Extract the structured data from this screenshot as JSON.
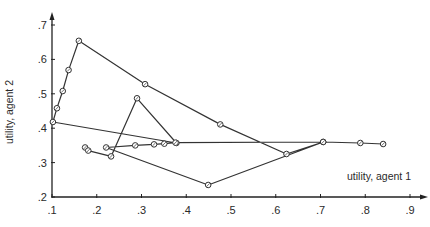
{
  "chart_data": {
    "type": "line",
    "title": "",
    "xlabel": "utility, agent 1",
    "ylabel": "utility, agent 2",
    "xlim": [
      0.1,
      0.9
    ],
    "ylim": [
      0.2,
      0.7
    ],
    "grid": false,
    "legend": null,
    "x_ticks": [
      ".1",
      ".2",
      ".3",
      ".4",
      ".5",
      ".6",
      ".7",
      ".8",
      ".9"
    ],
    "y_ticks": [
      ".2",
      ".3",
      ".4",
      ".5",
      ".6",
      ".7"
    ],
    "colors": {
      "line": "#333333",
      "marker": "#333333",
      "axis": "#222222"
    },
    "series": [
      {
        "name": "utility path",
        "marker": "circle-open",
        "points": [
          [
            0.174,
            0.344
          ],
          [
            0.181,
            0.335
          ],
          [
            0.232,
            0.318
          ],
          [
            0.29,
            0.487
          ],
          [
            0.378,
            0.357
          ],
          [
            0.102,
            0.418
          ],
          [
            0.111,
            0.458
          ],
          [
            0.124,
            0.508
          ],
          [
            0.137,
            0.569
          ],
          [
            0.16,
            0.654
          ],
          [
            0.308,
            0.528
          ],
          [
            0.476,
            0.411
          ],
          [
            0.624,
            0.325
          ],
          [
            0.706,
            0.36
          ],
          [
            0.449,
            0.235
          ],
          [
            0.221,
            0.344
          ],
          [
            0.286,
            0.35
          ],
          [
            0.328,
            0.353
          ],
          [
            0.351,
            0.355
          ],
          [
            0.376,
            0.358
          ],
          [
            0.706,
            0.36
          ],
          [
            0.789,
            0.357
          ],
          [
            0.84,
            0.354
          ]
        ]
      }
    ]
  }
}
